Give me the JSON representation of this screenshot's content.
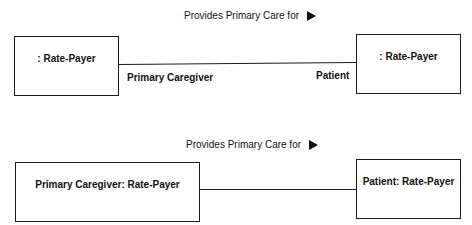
{
  "diagrams": [
    {
      "association": {
        "name": "Provides Primary Care for",
        "direction_icon": "right-triangle-arrow"
      },
      "left_object": {
        "label": ": Rate-Payer"
      },
      "right_object": {
        "label": ": Rate-Payer"
      },
      "left_role": "Primary Caregiver",
      "right_role": "Patient"
    },
    {
      "association": {
        "name": "Provides Primary Care for",
        "direction_icon": "right-triangle-arrow"
      },
      "left_object": {
        "label": "Primary Caregiver: Rate-Payer"
      },
      "right_object": {
        "label": "Patient: Rate-Payer"
      }
    }
  ],
  "colors": {
    "stroke": "#1a1a1a",
    "text": "#111111",
    "background": "#ffffff"
  }
}
